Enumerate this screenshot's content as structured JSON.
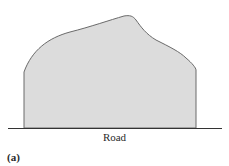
{
  "figure": {
    "road_label": "Road",
    "panel_label": "(a)",
    "colors": {
      "fill": "#dcdcdc",
      "outline": "#6a6a6a",
      "road_line": "#333333"
    }
  }
}
